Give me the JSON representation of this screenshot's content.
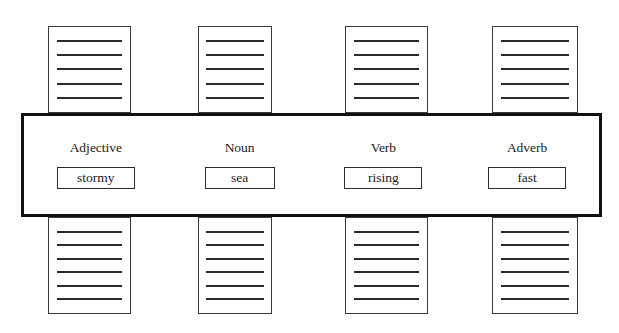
{
  "diagram": {
    "type": "sentence-builder-word-selector",
    "background_color": "#ffffff",
    "band_border_color": "#111111",
    "card_border_color": "#3a3a3a",
    "line_color": "#2b2b2b"
  },
  "columns": [
    {
      "label": "Adjective",
      "value": "stormy",
      "top_card": {
        "lines": 5,
        "x": 48,
        "y": 26,
        "width": 83,
        "height": 87
      },
      "bottom_card": {
        "lines": 6,
        "x": 48,
        "y": 217,
        "width": 83,
        "height": 97
      },
      "field_box": {
        "x": 52,
        "y": 169,
        "width": 78,
        "height": 22
      }
    },
    {
      "label": "Noun",
      "value": "sea",
      "top_card": {
        "lines": 5,
        "x": 198,
        "y": 26,
        "width": 74,
        "height": 87
      },
      "bottom_card": {
        "lines": 6,
        "x": 198,
        "y": 217,
        "width": 74,
        "height": 97
      },
      "field_box": {
        "x": 200,
        "y": 169,
        "width": 70,
        "height": 22
      }
    },
    {
      "label": "Verb",
      "value": "rising",
      "top_card": {
        "lines": 5,
        "x": 345,
        "y": 26,
        "width": 83,
        "height": 87
      },
      "bottom_card": {
        "lines": 6,
        "x": 345,
        "y": 217,
        "width": 83,
        "height": 97
      },
      "field_box": {
        "x": 348,
        "y": 169,
        "width": 78,
        "height": 22
      }
    },
    {
      "label": "Adverb",
      "value": "fast",
      "top_card": {
        "lines": 5,
        "x": 492,
        "y": 26,
        "width": 86,
        "height": 87
      },
      "bottom_card": {
        "lines": 6,
        "x": 492,
        "y": 217,
        "width": 86,
        "height": 97
      },
      "field_box": {
        "x": 495,
        "y": 169,
        "width": 78,
        "height": 22
      }
    }
  ]
}
